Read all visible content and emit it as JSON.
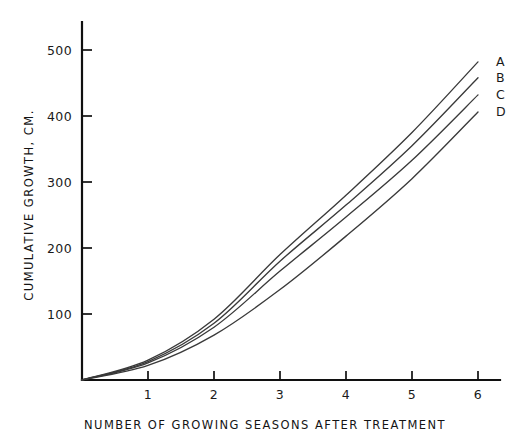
{
  "chart_data": {
    "type": "line",
    "title": "",
    "xlabel": "NUMBER OF GROWING SEASONS AFTER TREATMENT",
    "ylabel": "CUMULATIVE GROWTH, CM.",
    "xlim": [
      0,
      6.4
    ],
    "ylim": [
      0,
      545
    ],
    "grid": false,
    "legend_position": "right-inline-end-labels",
    "x_ticks": [
      1,
      2,
      3,
      4,
      5,
      6
    ],
    "x_tick_labels": [
      "1",
      "2",
      "3",
      "4",
      "5",
      "6"
    ],
    "y_ticks": [
      100,
      200,
      300,
      400,
      500
    ],
    "y_tick_labels": [
      "100",
      "200",
      "300",
      "400",
      "500"
    ],
    "x": [
      0,
      1,
      2,
      3,
      4,
      5,
      6
    ],
    "series": [
      {
        "name": "A",
        "label": "A",
        "values": [
          0,
          30,
          92,
          190,
          280,
          375,
          482
        ]
      },
      {
        "name": "B",
        "label": "B",
        "values": [
          0,
          28,
          86,
          180,
          265,
          355,
          458
        ]
      },
      {
        "name": "C",
        "label": "C",
        "values": [
          0,
          26,
          80,
          165,
          247,
          333,
          432
        ]
      },
      {
        "name": "D",
        "label": "D",
        "values": [
          0,
          22,
          68,
          137,
          218,
          305,
          406
        ]
      }
    ],
    "series_colors": [
      "#3a3a3a",
      "#3a3a3a",
      "#3a3a3a",
      "#3a3a3a"
    ]
  }
}
